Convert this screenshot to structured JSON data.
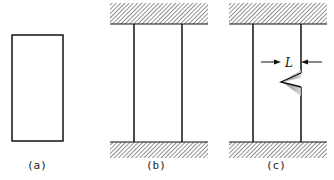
{
  "figure": {
    "panels": [
      {
        "id": "a",
        "label": "(a)",
        "description": "isolated rectangular specimen"
      },
      {
        "id": "b",
        "label": "(b)",
        "description": "specimen clamped between fixed walls"
      },
      {
        "id": "c",
        "label": "(c)",
        "description": "clamped specimen with edge crack of length L"
      }
    ],
    "annotation": {
      "dimension_label": "L"
    },
    "colors": {
      "line": "#111111",
      "hatch": "#333333",
      "background": "#ffffff"
    }
  }
}
